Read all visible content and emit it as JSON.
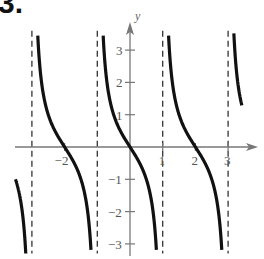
{
  "problem_number": "3.",
  "chart_data": {
    "type": "line",
    "title": "",
    "xlabel": "",
    "ylabel": "y",
    "function": "y = -tan(pi*x/2)",
    "period": 2,
    "x_range": [
      -3.5,
      3.7
    ],
    "y_range": [
      -3.3,
      3.6
    ],
    "xlim": [
      -3.5,
      3.9
    ],
    "ylim": [
      -3.3,
      3.7
    ],
    "x_ticks": [
      -2,
      1,
      2,
      3
    ],
    "x_tick_labels": [
      "−2",
      "1",
      "2",
      "3"
    ],
    "y_ticks": [
      -3,
      -2,
      -1,
      1,
      2,
      3
    ],
    "y_tick_labels": [
      "−3",
      "−2",
      "−1",
      "1",
      "2",
      "3"
    ],
    "asymptotes": [
      -3,
      -1,
      1,
      3
    ],
    "zeros": [
      -2,
      0,
      2
    ],
    "grid": false,
    "legend": null,
    "series": [
      {
        "name": "branch-1",
        "x": [
          -3.5,
          -3.4,
          -3.3,
          -3.2,
          -3.1
        ],
        "y": [
          -1.0,
          -1.38,
          -1.96,
          -3.08,
          -6.31
        ]
      },
      {
        "name": "branch-2",
        "x": [
          -2.9,
          -2.8,
          -2.6,
          -2.4,
          -2.2,
          -2.0,
          -1.8,
          -1.6,
          -1.4,
          -1.2,
          -1.1
        ],
        "y": [
          6.31,
          3.08,
          1.38,
          0.73,
          0.32,
          0.0,
          -0.32,
          -0.73,
          -1.38,
          -3.08,
          -6.31
        ]
      },
      {
        "name": "branch-3",
        "x": [
          -0.9,
          -0.8,
          -0.6,
          -0.4,
          -0.2,
          0.0,
          0.2,
          0.4,
          0.6,
          0.8,
          0.9
        ],
        "y": [
          6.31,
          3.08,
          1.38,
          0.73,
          0.32,
          0.0,
          -0.32,
          -0.73,
          -1.38,
          -3.08,
          -6.31
        ]
      },
      {
        "name": "branch-4",
        "x": [
          1.1,
          1.2,
          1.4,
          1.6,
          1.8,
          2.0,
          2.2,
          2.4,
          2.6,
          2.8,
          2.9
        ],
        "y": [
          6.31,
          3.08,
          1.38,
          0.73,
          0.32,
          0.0,
          -0.32,
          -0.73,
          -1.38,
          -3.08,
          -6.31
        ]
      },
      {
        "name": "branch-5",
        "x": [
          3.1,
          3.2,
          3.3,
          3.4,
          3.45
        ],
        "y": [
          6.31,
          3.08,
          1.96,
          1.38,
          1.17
        ]
      }
    ]
  },
  "style": {
    "curve_color": "#111111",
    "axis_color": "#777777",
    "asymptote_color": "#333333",
    "label_color": "#555555"
  }
}
